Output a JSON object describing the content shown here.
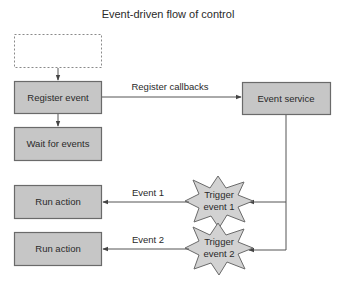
{
  "title": "Event-driven flow of control",
  "colors": {
    "node_fill": "#c6c6c6",
    "node_stroke": "#6a6a6a",
    "star_fill": "#d2d2d2",
    "edge": "#555555",
    "text": "#2a2a2a"
  },
  "nodes": {
    "placeholder": {
      "label": ""
    },
    "register_event": {
      "label": "Register event"
    },
    "wait_for_events": {
      "label": "Wait for events"
    },
    "event_service": {
      "label": "Event service"
    },
    "run_action_1": {
      "label": "Run action"
    },
    "run_action_2": {
      "label": "Run action"
    },
    "trigger_1": {
      "line1": "Trigger",
      "line2": "event 1"
    },
    "trigger_2": {
      "line1": "Trigger",
      "line2": "event 2"
    }
  },
  "edges": {
    "register_callbacks": {
      "label": "Register callbacks"
    },
    "event_1": {
      "label": "Event 1"
    },
    "event_2": {
      "label": "Event 2"
    }
  }
}
